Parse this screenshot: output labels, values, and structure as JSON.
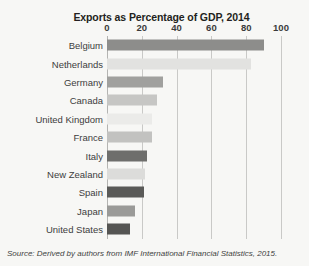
{
  "chart_data": {
    "type": "bar",
    "orientation": "horizontal",
    "title": "Exports as Percentage of GDP, 2014",
    "xlabel": "",
    "ylabel": "",
    "xlim": [
      0,
      100
    ],
    "xticks": [
      0,
      20,
      40,
      60,
      80,
      100
    ],
    "grid": true,
    "legend": false,
    "categories": [
      "Belgium",
      "Netherlands",
      "Germany",
      "Canada",
      "United Kingdom",
      "France",
      "Italy",
      "New Zealand",
      "Spain",
      "Japan",
      "United States"
    ],
    "values": [
      90,
      83,
      32,
      29,
      26,
      26,
      23,
      22,
      21,
      16,
      13
    ],
    "bar_colors": [
      "#8d8d8b",
      "#e2e2e0",
      "#a0a09e",
      "#c6c6c4",
      "#ebebe9",
      "#c2c2c0",
      "#6e6e6c",
      "#dcdcda",
      "#5a5a58",
      "#9a9a98",
      "#555553"
    ]
  },
  "source": {
    "prefix": "Source: Derived by authors from ",
    "publication": "IMF International Financial Statistics",
    "suffix": ", 2015."
  },
  "colors": {
    "background": "#f7f7f5",
    "gridline": "#c9c9c7",
    "text": "#3d3d3d",
    "title": "#231f20"
  }
}
